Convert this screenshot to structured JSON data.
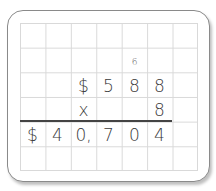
{
  "problem": {
    "carry": "6",
    "row1": [
      "$",
      "5",
      "8",
      "8"
    ],
    "operator": "x",
    "multiplier": "8",
    "answer": [
      "$",
      "4",
      "0,",
      "7",
      "0",
      "4"
    ]
  }
}
